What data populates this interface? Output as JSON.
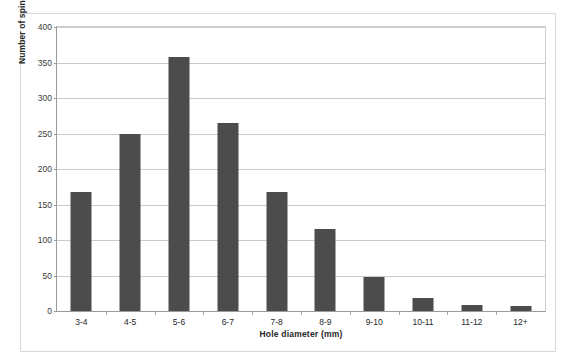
{
  "chart_data": {
    "type": "bar",
    "title": "",
    "xlabel": "Hole diameter (mm)",
    "ylabel": "Number of spindle whorls",
    "categories": [
      "3-4",
      "4-5",
      "5-6",
      "6-7",
      "7-8",
      "8-9",
      "9-10",
      "10-11",
      "11-12",
      "12+"
    ],
    "values": [
      167,
      249,
      358,
      265,
      168,
      115,
      48,
      18,
      9,
      7
    ],
    "ylim": [
      0,
      400
    ],
    "yticks": [
      0,
      50,
      100,
      150,
      200,
      250,
      300,
      350,
      400
    ],
    "ytick_labels": [
      "0",
      "50",
      "100",
      "150",
      "200",
      "250",
      "300",
      "350",
      "400"
    ],
    "grid": true,
    "legend": false,
    "bar_color": "#4c4c4c",
    "grid_color": "#cbcbcb",
    "axis_color": "#9a9a9a",
    "background": "#ffffff"
  }
}
